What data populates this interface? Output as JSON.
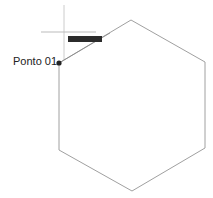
{
  "diagram": {
    "point_label": "Ponto 01",
    "tooltip_text": "",
    "colors": {
      "hexagon_stroke": "#a0a0a0",
      "crosshair": "#c8c8c8",
      "point": "#222222",
      "tooltip_bg": "#2b2b2b"
    }
  }
}
